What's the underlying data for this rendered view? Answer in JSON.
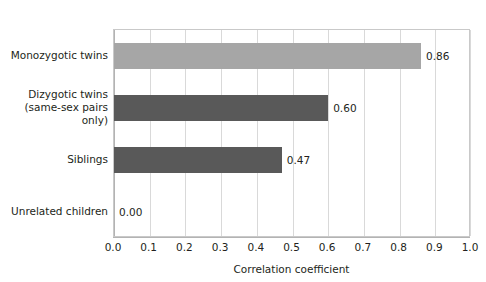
{
  "chart_data": {
    "type": "bar",
    "orientation": "horizontal",
    "title": "",
    "xlabel": "Correlation coefficient",
    "ylabel": "",
    "xlim": [
      0.0,
      1.0
    ],
    "grid": true,
    "legend": false,
    "categories": [
      "Monozygotic twins",
      "Dizygotic twins\n(same-sex pairs only)",
      "Siblings",
      "Unrelated children"
    ],
    "values": [
      0.86,
      0.6,
      0.47,
      0.0
    ],
    "value_labels": [
      "0.86",
      "0.60",
      "0.47",
      "0.00"
    ],
    "bar_colors": [
      "#a6a6a6",
      "#595959",
      "#595959",
      "#595959"
    ],
    "xtick_labels": [
      "0.0",
      "0.1",
      "0.2",
      "0.3",
      "0.4",
      "0.5",
      "0.6",
      "0.7",
      "0.8",
      "0.9",
      "1.0"
    ],
    "xtick_values": [
      0.0,
      0.1,
      0.2,
      0.3,
      0.4,
      0.5,
      0.6,
      0.7,
      0.8,
      0.9,
      1.0
    ],
    "colors": {
      "light_bar": "#a6a6a6",
      "dark_bar": "#595959",
      "gridline": "#d9d9d9",
      "axis": "#b3b3b3",
      "text": "#231f20",
      "background": "#ffffff"
    }
  }
}
